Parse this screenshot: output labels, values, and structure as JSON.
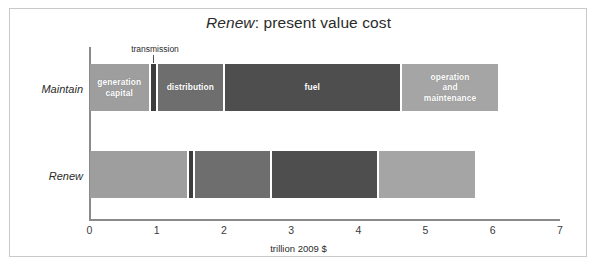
{
  "chart_data": {
    "type": "bar",
    "orientation": "horizontal",
    "stacked": true,
    "title": "Renew: present value cost",
    "title_italic_part": "Renew",
    "title_rest": ": present value cost",
    "xlabel": "trillion 2009 $",
    "ylabel": "",
    "xlim": [
      0,
      7
    ],
    "xticks": [
      0,
      1,
      2,
      3,
      4,
      5,
      6,
      7
    ],
    "xtick_labels": [
      "0",
      "1",
      "2",
      "3",
      "4",
      "5",
      "6",
      "7"
    ],
    "grid": false,
    "legend": "none (segments labeled in place)",
    "categories": [
      "Maintain",
      "Renew"
    ],
    "series": [
      {
        "name": "generation capital",
        "values": [
          0.9,
          1.46
        ],
        "color": "#9e9e9e"
      },
      {
        "name": "transmission",
        "values": [
          0.1,
          0.1
        ],
        "color": "#3d3d3d"
      },
      {
        "name": "distribution",
        "values": [
          1.0,
          1.1
        ],
        "color": "#6e6e6e"
      },
      {
        "name": "fuel",
        "values": [
          2.63,
          1.6
        ],
        "color": "#4e4e4e"
      },
      {
        "name": "operation and maintenance",
        "values": [
          1.47,
          1.49
        ],
        "color": "#a5a5a5"
      }
    ],
    "bars": [
      {
        "category": "Maintain",
        "total": 6.1,
        "segments": [
          {
            "label": "generation capital",
            "start": 0.0,
            "end": 0.9,
            "value": 0.9,
            "color": "#9e9e9e",
            "show_label": true
          },
          {
            "label": "transmission",
            "start": 0.9,
            "end": 1.0,
            "value": 0.1,
            "color": "#3d3d3d",
            "show_label": false
          },
          {
            "label": "distribution",
            "start": 1.0,
            "end": 2.0,
            "value": 1.0,
            "color": "#6e6e6e",
            "show_label": true
          },
          {
            "label": "fuel",
            "start": 2.0,
            "end": 4.63,
            "value": 2.63,
            "color": "#4e4e4e",
            "show_label": true
          },
          {
            "label": "operation and maintenance",
            "start": 4.63,
            "end": 6.1,
            "value": 1.47,
            "color": "#a5a5a5",
            "show_label": true
          }
        ]
      },
      {
        "category": "Renew",
        "total": 5.75,
        "segments": [
          {
            "label": "generation capital",
            "start": 0.0,
            "end": 1.46,
            "value": 1.46,
            "color": "#9e9e9e",
            "show_label": false
          },
          {
            "label": "transmission",
            "start": 1.46,
            "end": 1.56,
            "value": 0.1,
            "color": "#3d3d3d",
            "show_label": false
          },
          {
            "label": "distribution",
            "start": 1.56,
            "end": 2.7,
            "value": 1.14,
            "color": "#6e6e6e",
            "show_label": false
          },
          {
            "label": "fuel",
            "start": 2.7,
            "end": 4.3,
            "value": 1.6,
            "color": "#4e4e4e",
            "show_label": false
          },
          {
            "label": "operation and maintenance",
            "start": 4.3,
            "end": 5.75,
            "value": 1.45,
            "color": "#a5a5a5",
            "show_label": false
          }
        ]
      }
    ],
    "annotations": [
      {
        "text": "transmission",
        "points_to": "transmission segment of Maintain bar",
        "x": 0.95
      }
    ]
  },
  "colors": {
    "frame_border": "#c9c9c9",
    "axis": "#8a8a8a",
    "text": "#2b2b2b",
    "background": "#ffffff"
  }
}
